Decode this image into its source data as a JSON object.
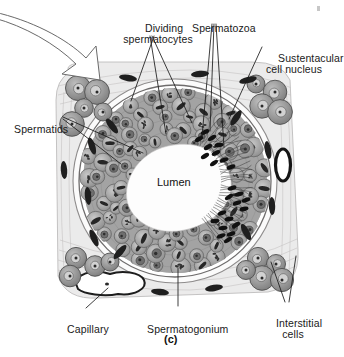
{
  "figure": {
    "caption": "(c)",
    "background_color": "#ffffff",
    "ink_color": "#1a1a1a"
  },
  "labels": [
    {
      "id": "dividing-spermatocytes",
      "text": "Dividing\nspermatocytes",
      "x": 116,
      "y": 11,
      "align": "center",
      "width": 84
    },
    {
      "id": "spermatozoa",
      "text": "Spermatozoa",
      "x": 180,
      "y": 11,
      "align": "left",
      "width": 72
    },
    {
      "id": "sustentacular-cell-nucleus",
      "text": "Sustentacular\ncell nucleus",
      "x": 266,
      "y": 41,
      "align": "left",
      "width": 76
    },
    {
      "id": "spermatids",
      "text": "Spermatids",
      "x": 2,
      "y": 112,
      "align": "left",
      "width": 60
    },
    {
      "id": "lumen",
      "text": "Lumen",
      "x": 157,
      "y": 178,
      "align": "left",
      "width": 42
    },
    {
      "id": "capillary",
      "text": "Capillary",
      "x": 55,
      "y": 312,
      "align": "left",
      "width": 52
    },
    {
      "id": "spermatogonium",
      "text": "Spermatogonium",
      "x": 135,
      "y": 312,
      "align": "left",
      "width": 92
    },
    {
      "id": "interstitial-cells",
      "text": "Interstitial\ncells",
      "x": 263,
      "y": 306,
      "align": "center",
      "width": 60
    }
  ],
  "annotations": {
    "arrow": {
      "id": "curved-arrow",
      "description": "curved outline arrow pointing down-right",
      "color": "#555555"
    }
  },
  "structures": [
    {
      "id": "interstitial-tissue",
      "label": "Interstitial tissue",
      "color": "#eceaea"
    },
    {
      "id": "tubule-wall",
      "label": "Tunica propria / basement membrane",
      "color": "#ffffff"
    },
    {
      "id": "germinal-epithelium",
      "label": "Germinal epithelium",
      "color": "#9c9c9c"
    },
    {
      "id": "lumen-space",
      "label": "Lumen",
      "color": "#fbfbfb"
    },
    {
      "id": "capillary-vessel",
      "label": "Capillary",
      "color": "#ffffff"
    },
    {
      "id": "blood-vessel-right",
      "label": "Blood vessel",
      "color": "#2a2a2a"
    },
    {
      "id": "interstitial-cell-cluster",
      "label": "Interstitial (Leydig) cells",
      "color": "#8e8e8e"
    },
    {
      "id": "spermatozoa-heads",
      "label": "Spermatozoa heads",
      "color": "#141414"
    }
  ]
}
